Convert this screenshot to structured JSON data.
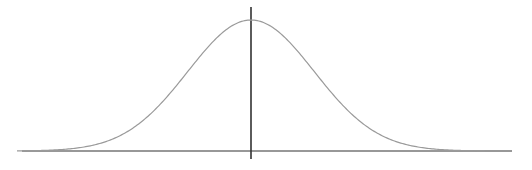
{
  "chart_data": {
    "type": "line",
    "title": "",
    "subtitle": "",
    "xlabel": "",
    "ylabel": "",
    "series": [
      {
        "name": "normal-pdf",
        "mean": 0,
        "std": 1,
        "x": [
          -3.5,
          -3,
          -2.5,
          -2,
          -1.5,
          -1,
          -0.5,
          0,
          0.5,
          1,
          1.5,
          2,
          2.5,
          3,
          3.5
        ],
        "values": [
          0.0009,
          0.0044,
          0.0175,
          0.054,
          0.1295,
          0.242,
          0.3521,
          0.3989,
          0.3521,
          0.242,
          0.1295,
          0.054,
          0.0175,
          0.0044,
          0.0009
        ]
      }
    ],
    "xlim": [
      -3.7,
      3.7
    ],
    "ylim": [
      0,
      0.44
    ],
    "grid": false,
    "legend": null,
    "x_ticks": [],
    "y_ticks": [],
    "colors": {
      "curve": "#9a9a9a",
      "axis": "#333333",
      "background": "#ffffff"
    }
  }
}
